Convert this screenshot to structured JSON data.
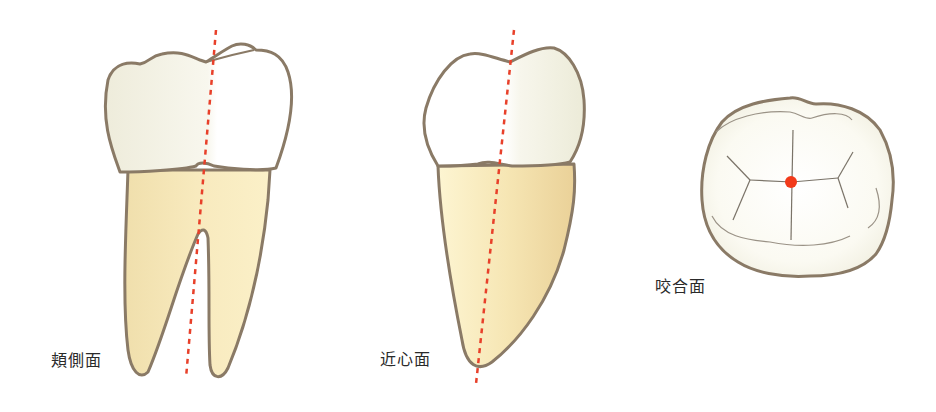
{
  "figure": {
    "views": [
      {
        "id": "buccal",
        "label": "頬側面"
      },
      {
        "id": "mesial",
        "label": "近心面"
      },
      {
        "id": "occlusal",
        "label": "咬合面"
      }
    ]
  },
  "colors": {
    "outline": "#8a7a66",
    "crown_light": "#ffffff",
    "crown_shade": "#f1efde",
    "root_light": "#fbf2cd",
    "root_shade": "#eed9a2",
    "axis_line": "#e8402a",
    "center_dot": "#f23a1a",
    "groove": "#7a7368",
    "label_text": "#2a2a2a"
  }
}
